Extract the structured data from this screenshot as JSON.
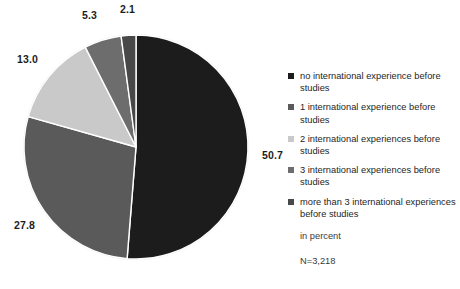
{
  "chart_data": {
    "type": "pie",
    "title": "",
    "subtitle": "",
    "xlabel": "",
    "ylabel": "",
    "unit_note": "in percent",
    "sample_note": "N=3,218",
    "legend_position": "right",
    "grid": false,
    "start_angle_deg": 0,
    "direction": "clockwise",
    "categories": [
      "no international experience before studies",
      "1 international experience before studies",
      "2 international experiences before studies",
      "3 international experiences before studies",
      "more than 3 international experiences before studies"
    ],
    "values": [
      50.7,
      27.8,
      13.0,
      5.3,
      2.1
    ],
    "value_labels": [
      "50.7",
      "27.8",
      "13.0",
      "5.3",
      "2.1"
    ],
    "colors": [
      "#1c1c1c",
      "#5a5a5a",
      "#c9c9c9",
      "#6d6d6d",
      "#484848"
    ],
    "slice_separator_color": "#ffffff"
  },
  "labels": {
    "slice_0": "50.7",
    "slice_1": "27.8",
    "slice_2": "13.0",
    "slice_3": "5.3",
    "slice_4": "2.1"
  },
  "legend": {
    "items": [
      {
        "label": "no international experience before studies",
        "color": "#1c1c1c"
      },
      {
        "label": "1 international experience before studies",
        "color": "#5a5a5a"
      },
      {
        "label": "2 international experiences before studies",
        "color": "#c9c9c9"
      },
      {
        "label": "3 international experiences before studies",
        "color": "#6d6d6d"
      },
      {
        "label": "more than 3 international experiences before studies",
        "color": "#484848"
      }
    ]
  },
  "notes": {
    "unit": "in percent",
    "sample_size": "N=3,218"
  }
}
